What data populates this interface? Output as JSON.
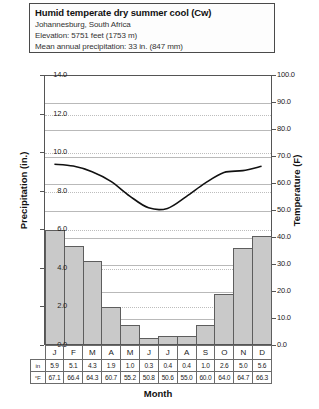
{
  "header": {
    "title": "Humid temperate dry summer cool (Cw)",
    "location": "Johannesburg, South Africa",
    "elevation": "Elevation:  5751 feet (1753 m)",
    "precip_annual": "Mean annual precipitation: 33 in. (847 mm)"
  },
  "axes": {
    "ylabel_left": "Precipitation (in.)",
    "ylabel_right": "Temperature (F)",
    "xlabel": "Month",
    "left_ticks": [
      "14.0",
      "12.0",
      "10.0",
      "8.0",
      "6.0",
      "4.0",
      "2.0",
      "0.0"
    ],
    "right_ticks": [
      "100.0",
      "90.0",
      "80.0",
      "70.0",
      "60.0",
      "50.0",
      "40.0",
      "30.0",
      "20.0",
      "10.0",
      "0.0"
    ]
  },
  "table": {
    "precip_row_label": "in",
    "temp_row_label": "°F"
  },
  "chart_data": {
    "type": "bar",
    "title": "Humid temperate dry summer cool (Cw)",
    "subtitle": "Johannesburg, South Africa",
    "xlabel": "Month",
    "ylabel": "Precipitation (in.)",
    "ylabel_secondary": "Temperature (F)",
    "ylim": [
      0,
      14
    ],
    "ylim_secondary": [
      0,
      100
    ],
    "grid": true,
    "legend": "none",
    "categories": [
      "J",
      "F",
      "M",
      "A",
      "M",
      "J",
      "J",
      "A",
      "S",
      "O",
      "N",
      "D"
    ],
    "series": [
      {
        "name": "Precipitation (in.)",
        "type": "bar",
        "axis": "left",
        "values": [
          5.9,
          5.1,
          4.3,
          1.9,
          1.0,
          0.3,
          0.4,
          0.4,
          1.0,
          2.6,
          5.0,
          5.6
        ]
      },
      {
        "name": "Temperature (F)",
        "type": "line",
        "axis": "right",
        "values": [
          67.1,
          66.4,
          64.3,
          60.7,
          55.2,
          50.8,
          50.6,
          55.0,
          60.0,
          64.0,
          64.7,
          66.3
        ]
      }
    ]
  }
}
